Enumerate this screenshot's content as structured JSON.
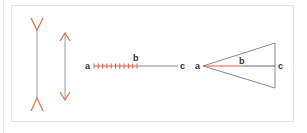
{
  "colors": {
    "accent": "#d9784f",
    "highlight": "#e05a4a",
    "line": "#8a8a8a",
    "frame": "#e4e4e4",
    "text": "#333333"
  },
  "figures": {
    "muller_lyer": {
      "fins_out_label": "",
      "arrows_in_label": ""
    },
    "bisected_line": {
      "labels": {
        "a": "a",
        "b": "b",
        "c": "c"
      },
      "tick_count": 11
    },
    "triangle": {
      "labels": {
        "a": "a",
        "b": "b",
        "c": "c"
      }
    }
  }
}
